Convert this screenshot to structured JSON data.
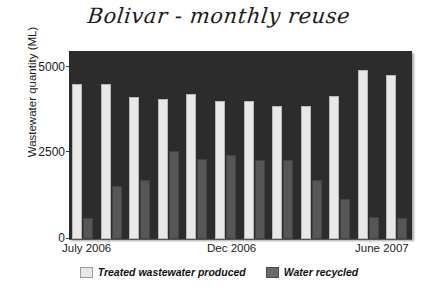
{
  "chart_data": {
    "type": "bar",
    "title": "Bolivar - monthly reuse",
    "xlabel": "",
    "ylabel": "Wastewater quantity (ML)",
    "ylim": [
      0,
      5000
    ],
    "yticks": [
      0,
      2500,
      5000
    ],
    "ytick_labels": [
      "0",
      "2500",
      "5000"
    ],
    "grid": false,
    "legend_position": "bottom",
    "categories": [
      "July 2006",
      "Aug 2006",
      "Sept 2006",
      "Oct 2006",
      "Nov 2006",
      "Dec 2006",
      "Jan 2007",
      "Feb 2007",
      "Mar 2007",
      "Apr 2007",
      "May 2007",
      "June 2007"
    ],
    "xtick_labels": [
      "July 2006",
      "Dec 2006",
      "June 2007"
    ],
    "series": [
      {
        "name": "Treated wastewater produced",
        "color": "#e8e8e6",
        "values": [
          4470,
          4480,
          4100,
          4050,
          4180,
          3980,
          4000,
          3830,
          3840,
          4120,
          4890,
          4740
        ]
      },
      {
        "name": "Water recycled",
        "color": "#565656",
        "values": [
          620,
          1530,
          1720,
          2540,
          2320,
          2440,
          2280,
          2270,
          1710,
          1170,
          650,
          600
        ]
      }
    ]
  },
  "axes": {
    "y_title": "Wastewater quantity (ML)",
    "x_label_start": "July 2006",
    "x_label_mid": "Dec 2006",
    "x_label_end": "June 2007",
    "y_tick_0": "0",
    "y_tick_1": "2500",
    "y_tick_2": "5000"
  },
  "legend": {
    "items": [
      {
        "label": "Treated wastewater produced",
        "swatch": "light-swatch-icon"
      },
      {
        "label": "Water recycled",
        "swatch": "dark-swatch-icon"
      }
    ]
  },
  "colors": {
    "plot_background": "#2c2c2c",
    "produced": "#e8e8e6",
    "recycled": "#565656",
    "text": "#1a1a1a",
    "page_background": "#ffffff"
  }
}
